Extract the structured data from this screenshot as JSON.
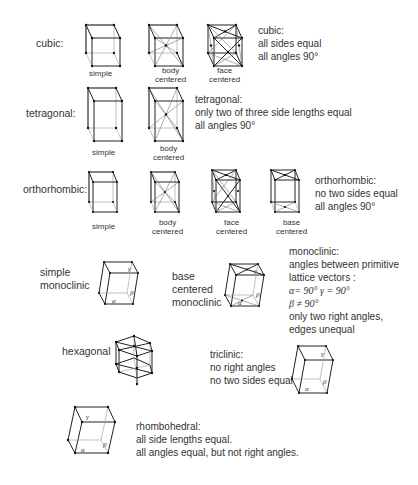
{
  "rows": [
    {
      "system": "cubic",
      "label": "cubic:",
      "variants": [
        "simple",
        "body centered",
        "face centered"
      ],
      "description": [
        "cubic:",
        "all sides equal",
        "all angles 90°"
      ]
    },
    {
      "system": "tetragonal",
      "label": "tetragonal:",
      "variants": [
        "simple",
        "body centered"
      ],
      "description": [
        "tetragonal:",
        "only two of three side lengths equal",
        "all angles 90°"
      ]
    },
    {
      "system": "orthorhombic",
      "label": "orthorhombic:",
      "variants": [
        "simple",
        "body centered",
        "face centered",
        "base centered"
      ],
      "description": [
        "orthorhombic:",
        "no two sides equal",
        "all angles 90°"
      ]
    },
    {
      "system": "monoclinic",
      "labels": [
        "simple monoclinic",
        "base centered monoclinic"
      ],
      "simple_label": [
        "simple",
        "monoclinic"
      ],
      "base_label": [
        "base",
        "centered",
        "monoclinic"
      ],
      "description": [
        "monoclinic:",
        "angles between primitive",
        "lattice vectors :",
        "α= 90°  γ = 90°",
        "β ≠ 90°",
        "only two right angles,",
        "edges unequal"
      ]
    },
    {
      "system": "hexagonal",
      "label": "hexagonal"
    },
    {
      "system": "triclinic",
      "description": [
        "triclinic:",
        "no right angles",
        "no two sides equal"
      ]
    },
    {
      "system": "rhombohedral",
      "description": [
        "rhombohedral:",
        "all side lengths equal.",
        "all angles equal, but not right angles."
      ]
    }
  ],
  "angle_symbols": {
    "alpha": "α",
    "beta": "β",
    "gamma": "γ"
  },
  "variant_caption": {
    "simple": "simple",
    "body": [
      "body",
      "centered"
    ],
    "face": [
      "face",
      "centered"
    ],
    "base": [
      "base",
      "centered"
    ]
  }
}
